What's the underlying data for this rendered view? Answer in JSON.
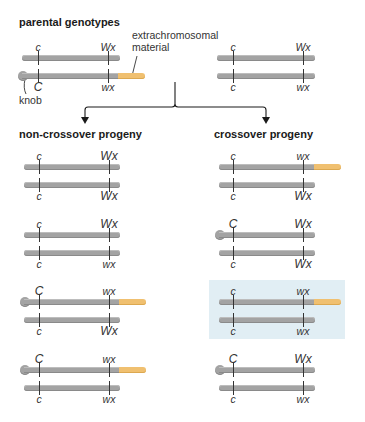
{
  "headings": {
    "parental": "parental genotypes",
    "non_crossover": "non-crossover progeny",
    "crossover": "crossover progeny"
  },
  "annotations": {
    "extrachromosomal_line1": "extrachromosomal",
    "extrachromosomal_line2": "material",
    "knob": "knob"
  },
  "colors": {
    "chromosome": "#a3a3a3",
    "extrachromosomal": "#f0c070",
    "highlight": "#e1eef4",
    "line": "#1a1a1a"
  },
  "parental": [
    {
      "top": {
        "c": "c",
        "wx": "Wx",
        "knob": false,
        "extra": false
      },
      "bottom": {
        "c": "C",
        "wx": "wx",
        "knob": true,
        "extra": true
      }
    },
    {
      "top": {
        "c": "c",
        "wx": "Wx",
        "knob": false,
        "extra": false
      },
      "bottom": {
        "c": "c",
        "wx": "wx",
        "knob": false,
        "extra": false
      }
    }
  ],
  "non_crossover_progeny": [
    {
      "top": {
        "c": "c",
        "wx": "Wx"
      },
      "bottom": {
        "c": "c",
        "wx": "Wx"
      }
    },
    {
      "top": {
        "c": "c",
        "wx": "Wx"
      },
      "bottom": {
        "c": "c",
        "wx": "wx"
      }
    },
    {
      "top": {
        "c": "C",
        "wx": "wx",
        "knob": true,
        "extra": true
      },
      "bottom": {
        "c": "c",
        "wx": "Wx"
      }
    },
    {
      "top": {
        "c": "C",
        "wx": "wx",
        "knob": true,
        "extra": true
      },
      "bottom": {
        "c": "c",
        "wx": "wx"
      }
    }
  ],
  "crossover_progeny": [
    {
      "top": {
        "c": "c",
        "wx": "wx",
        "extra": true
      },
      "bottom": {
        "c": "c",
        "wx": "Wx"
      }
    },
    {
      "top": {
        "c": "C",
        "wx": "Wx",
        "knob": true
      },
      "bottom": {
        "c": "c",
        "wx": "Wx"
      }
    },
    {
      "top": {
        "c": "c",
        "wx": "wx",
        "extra": true
      },
      "bottom": {
        "c": "c",
        "wx": "wx"
      },
      "highlighted": true
    },
    {
      "top": {
        "c": "C",
        "wx": "Wx",
        "knob": true
      },
      "bottom": {
        "c": "c",
        "wx": "wx"
      }
    }
  ]
}
